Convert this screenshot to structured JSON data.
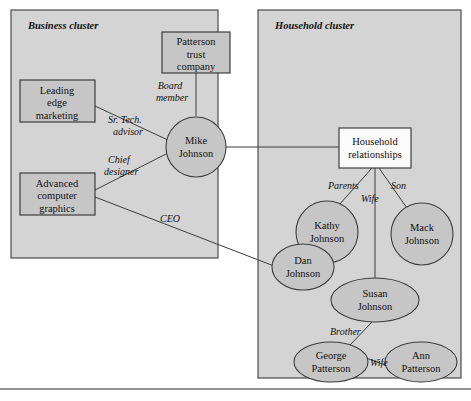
{
  "diagram": {
    "colors": {
      "cluster_fill": "#d4d4d4",
      "node_fill": "#c6c6c6",
      "node_fill_white": "#fbfbfb",
      "stroke": "#3d3d3d"
    },
    "clusters": [
      {
        "id": "business",
        "label": "Business cluster"
      },
      {
        "id": "household",
        "label": "Household cluster"
      }
    ],
    "nodes": {
      "patterson_trust": {
        "label_line1": "Patterson",
        "label_line2": "trust",
        "label_line3": "company",
        "shape": "rect"
      },
      "leading_edge": {
        "label_line1": "Leading",
        "label_line2": "edge",
        "label_line3": "marketing",
        "shape": "rect"
      },
      "advanced_graphics": {
        "label_line1": "Advanced",
        "label_line2": "computer",
        "label_line3": "graphics",
        "shape": "rect"
      },
      "mike_johnson": {
        "label_line1": "Mike",
        "label_line2": "Johnson",
        "shape": "circle"
      },
      "household_relationships": {
        "label_line1": "Household",
        "label_line2": "relationships",
        "shape": "rect"
      },
      "kathy_johnson": {
        "label_line1": "Kathy",
        "label_line2": "Johnson",
        "shape": "circle"
      },
      "mack_johnson": {
        "label_line1": "Mack",
        "label_line2": "Johnson",
        "shape": "circle"
      },
      "dan_johnson": {
        "label_line1": "Dan",
        "label_line2": "Johnson",
        "shape": "ellipse"
      },
      "susan_johnson": {
        "label_line1": "Susan",
        "label_line2": "Johnson",
        "shape": "ellipse"
      },
      "george_patterson": {
        "label_line1": "George",
        "label_line2": "Patterson",
        "shape": "ellipse"
      },
      "ann_patterson": {
        "label_line1": "Ann",
        "label_line2": "Patterson",
        "shape": "ellipse"
      }
    },
    "edge_labels": {
      "board_member_line1": "Board",
      "board_member_line2": "member",
      "sr_tech_advisor_line1": "Sr. Tech.",
      "sr_tech_advisor_line2": "advisor",
      "chief_designer_line1": "Chief",
      "chief_designer_line2": "designer",
      "ceo": "CEO",
      "parents": "Parents",
      "son": "Son",
      "wife": "Wife",
      "brother": "Brother",
      "wife2": "Wife"
    }
  }
}
